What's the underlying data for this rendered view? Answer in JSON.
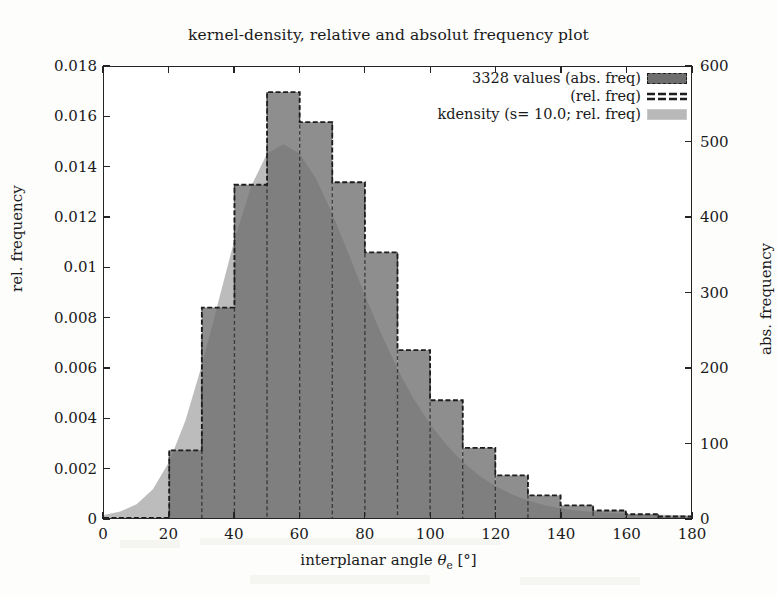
{
  "figure": {
    "title": "kernel-density, relative and absolut frequency plot",
    "background": "#fdfdfc",
    "frame_color": "#242424"
  },
  "axes": {
    "x": {
      "label_prefix": "interplanar angle ",
      "label_symbol": "θ",
      "label_subscript": "e",
      "label_suffix": " [°]",
      "ticks": [
        "0",
        "20",
        "40",
        "60",
        "80",
        "100",
        "120",
        "140",
        "160",
        "180"
      ],
      "min": 0,
      "max": 180
    },
    "y_left": {
      "label": "rel. frequency",
      "ticks": [
        "0",
        "0.002",
        "0.004",
        "0.006",
        "0.008",
        "0.01",
        "0.012",
        "0.014",
        "0.016",
        "0.018"
      ],
      "min": 0,
      "max": 0.018
    },
    "y_right": {
      "label": "abs. frequency",
      "ticks": [
        "0",
        "100",
        "200",
        "300",
        "400",
        "500",
        "600"
      ],
      "min": 0,
      "max": 600
    }
  },
  "legend": {
    "entries": [
      {
        "label": "3328 values (abs. freq)",
        "swatch": "dark-fill",
        "color": "#6e6e6e"
      },
      {
        "label": "(rel. freq)",
        "swatch": "dashed-line",
        "color": "#1d1d1d"
      },
      {
        "label": "kdensity (s= 10.0; rel. freq)",
        "swatch": "light-fill",
        "color": "#b9b9b9"
      }
    ]
  },
  "chart_data": {
    "type": "bar",
    "title": "kernel-density, relative and absolut frequency plot",
    "xlabel": "interplanar angle θe [°]",
    "ylabel": "rel. frequency",
    "ylabel_secondary": "abs. frequency",
    "xlim": [
      0,
      180
    ],
    "ylim": [
      0,
      0.018
    ],
    "ylim_secondary": [
      0,
      600
    ],
    "grid": false,
    "legend_position": "top-right",
    "n_values": 3328,
    "bin_width": 10,
    "bin_edges": [
      0,
      10,
      20,
      30,
      40,
      50,
      60,
      70,
      80,
      90,
      100,
      110,
      120,
      130,
      140,
      150,
      160,
      170,
      180
    ],
    "bin_centers": [
      5,
      15,
      25,
      35,
      45,
      55,
      65,
      75,
      85,
      95,
      105,
      115,
      125,
      135,
      145,
      155,
      165,
      175
    ],
    "categories": [
      "0-10",
      "10-20",
      "20-30",
      "30-40",
      "40-50",
      "50-60",
      "60-70",
      "70-80",
      "80-90",
      "90-100",
      "100-110",
      "110-120",
      "120-130",
      "130-140",
      "140-150",
      "150-160",
      "160-170",
      "170-180"
    ],
    "series": [
      {
        "name": "3328 values (abs. freq)",
        "unit": "counts",
        "axis": "right",
        "values": [
          0,
          0,
          90,
          280,
          443,
          566,
          527,
          446,
          352,
          222,
          155,
          93,
          57,
          30,
          17,
          10,
          5,
          2
        ]
      },
      {
        "name": "(rel. freq)",
        "unit": "relative frequency",
        "axis": "left",
        "values": [
          0.0,
          0.0,
          0.0027,
          0.0084,
          0.0133,
          0.017,
          0.0158,
          0.0134,
          0.0106,
          0.0067,
          0.0047,
          0.0028,
          0.0017,
          0.0009,
          0.0005,
          0.0003,
          0.00015,
          6e-05
        ]
      },
      {
        "name": "kdensity (s= 10.0; rel. freq)",
        "unit": "relative frequency",
        "axis": "left",
        "smoothing": 10.0,
        "x": [
          0,
          5,
          10,
          15,
          20,
          25,
          30,
          35,
          40,
          45,
          50,
          55,
          60,
          65,
          70,
          75,
          80,
          85,
          90,
          95,
          100,
          105,
          110,
          115,
          120,
          125,
          130,
          135,
          140,
          145,
          150,
          155,
          160,
          165,
          170,
          175,
          180
        ],
        "values": [
          0.00012,
          0.00026,
          0.00055,
          0.00115,
          0.00225,
          0.0039,
          0.0061,
          0.0086,
          0.0111,
          0.0132,
          0.01455,
          0.01492,
          0.01455,
          0.01355,
          0.01215,
          0.01055,
          0.0089,
          0.00735,
          0.00595,
          0.00475,
          0.00375,
          0.00292,
          0.00225,
          0.0017,
          0.00128,
          0.00095,
          0.0007,
          0.00052,
          0.00039,
          0.0003,
          0.00024,
          0.0002,
          0.00017,
          0.00015,
          0.00013,
          0.00012,
          0.0001
        ]
      }
    ]
  }
}
